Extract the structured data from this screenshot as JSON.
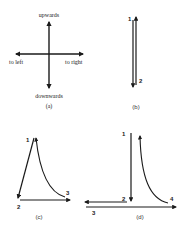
{
  "panel_a": {
    "caption": "(a)",
    "labels": {
      "up": "upwards",
      "down": "downwards",
      "left": "to left",
      "right": "to right"
    }
  },
  "panel_b": {
    "caption": "(b)",
    "points": [
      "1",
      "2"
    ]
  },
  "panel_c": {
    "caption": "(c)",
    "points": [
      "1",
      "2",
      "3"
    ]
  },
  "panel_d": {
    "caption": "(d)",
    "points": [
      "1",
      "2",
      "3",
      "4"
    ]
  },
  "colors": {
    "stroke": "#1a1a1a",
    "background": "#ffffff"
  }
}
